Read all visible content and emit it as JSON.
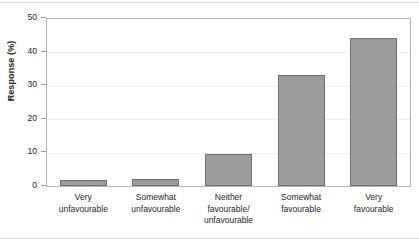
{
  "chart_data": {
    "type": "bar",
    "title": "",
    "xlabel": "",
    "ylabel": "Response (%)",
    "ylim": [
      0,
      50
    ],
    "yticks": [
      0,
      10,
      20,
      30,
      40,
      50
    ],
    "grid": true,
    "legend": false,
    "bar_color": "#9c9c9c",
    "bar_border_color": "#6f6f6f",
    "categories": [
      "Very\nunfavourable",
      "Somewhat\nunfavourable",
      "Neither\nfavourable/\nunfavourable",
      "Somewhat\nfavourable",
      "Very\nfavourable"
    ],
    "values": [
      1.8,
      2.1,
      9.5,
      33.1,
      44.4
    ]
  },
  "axis": {
    "y_title": "Response (%)",
    "y_tick_labels": [
      "50",
      "40",
      "30",
      "20",
      "10",
      "0"
    ]
  }
}
